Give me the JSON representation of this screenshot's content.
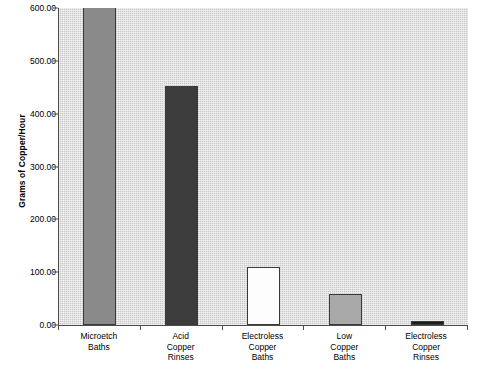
{
  "chart_data": {
    "type": "bar",
    "title": "",
    "xlabel": "",
    "ylabel": "Grams of Copper/Hour",
    "ylim": [
      0,
      600
    ],
    "grid": false,
    "legend": "none",
    "yticks": [
      "0.00",
      "100.00",
      "200.00",
      "300.00",
      "400.00",
      "500.00",
      "600.00"
    ],
    "ytick_values": [
      0,
      100,
      200,
      300,
      400,
      500,
      600
    ],
    "categories": [
      "Microetch Baths",
      "Acid Copper Rinses",
      "Electroless Copper Baths",
      "Low Copper Baths",
      "Electroless Copper Rinses"
    ],
    "category_lines": [
      [
        "Microetch",
        "Baths"
      ],
      [
        "Acid",
        "Copper",
        "Rinses"
      ],
      [
        "Electroless",
        "Copper",
        "Baths"
      ],
      [
        "Low",
        "Copper",
        "Baths"
      ],
      [
        "Electroless",
        "Copper",
        "Rinses"
      ]
    ],
    "values": [
      600,
      452,
      110,
      58,
      7
    ],
    "value_notes": [
      "clipped at top of axis",
      "",
      "",
      "",
      ""
    ],
    "bar_colors": [
      "#8a8a8a",
      "#3c3c3c",
      "#fdfdfd",
      "#a8a8a8",
      "#1e1e1e"
    ],
    "bar_edge_color": "#3a3a3a",
    "plot_background": "#c8c8c8",
    "axis_color": "#4c4c4c"
  },
  "caption": {
    "bottom_fragment": ""
  }
}
